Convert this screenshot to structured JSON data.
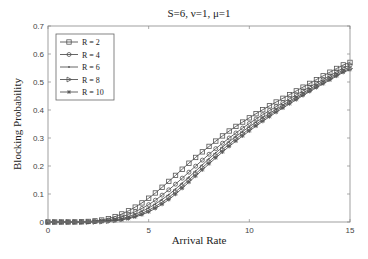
{
  "chart_data": {
    "type": "line",
    "title": "S=6,  ν=1, μ=1",
    "xlabel": "Arrival Rate",
    "ylabel": "Blocking Probability",
    "xlim": [
      0,
      15
    ],
    "ylim": [
      0,
      0.7
    ],
    "xticks": [
      0,
      5,
      10,
      15
    ],
    "yticks": [
      0,
      0.1,
      0.2,
      0.3,
      0.4,
      0.5,
      0.6,
      0.7
    ],
    "ytick_labels": [
      "0",
      "0.1",
      "0.2",
      "0.3",
      "0.4",
      "0.5",
      "0.6",
      "0.7"
    ],
    "grid": false,
    "legend_position": "upper left",
    "x": [
      0,
      1,
      2,
      3,
      4,
      5,
      6,
      7,
      8,
      9,
      10,
      11,
      12,
      13,
      14,
      15
    ],
    "series": [
      {
        "name": "R = 2",
        "marker": "square",
        "values": [
          0,
          0.0,
          0.002,
          0.012,
          0.04,
          0.085,
          0.145,
          0.21,
          0.27,
          0.325,
          0.372,
          0.415,
          0.455,
          0.495,
          0.535,
          0.57
        ]
      },
      {
        "name": "R = 4",
        "marker": "circle",
        "values": [
          0,
          0.0,
          0.001,
          0.007,
          0.027,
          0.062,
          0.115,
          0.178,
          0.242,
          0.3,
          0.352,
          0.398,
          0.44,
          0.482,
          0.522,
          0.56
        ]
      },
      {
        "name": "R = 6",
        "marker": "point",
        "values": [
          0,
          0.0,
          0.0,
          0.004,
          0.019,
          0.05,
          0.098,
          0.16,
          0.226,
          0.287,
          0.34,
          0.388,
          0.432,
          0.475,
          0.516,
          0.553
        ]
      },
      {
        "name": "R = 8",
        "marker": "triangle",
        "values": [
          0,
          0.0,
          0.0,
          0.003,
          0.015,
          0.042,
          0.088,
          0.15,
          0.216,
          0.278,
          0.332,
          0.382,
          0.427,
          0.47,
          0.511,
          0.548
        ]
      },
      {
        "name": "R = 10",
        "marker": "star",
        "values": [
          0,
          0.0,
          0.0,
          0.002,
          0.012,
          0.036,
          0.08,
          0.142,
          0.208,
          0.27,
          0.325,
          0.376,
          0.422,
          0.466,
          0.507,
          0.544
        ]
      }
    ],
    "samples_per_unit": 3
  },
  "style": {
    "line_color": "#555555",
    "axis_color": "#888888",
    "plot_area": {
      "left": 48,
      "top": 26,
      "right": 350,
      "bottom": 222
    }
  }
}
